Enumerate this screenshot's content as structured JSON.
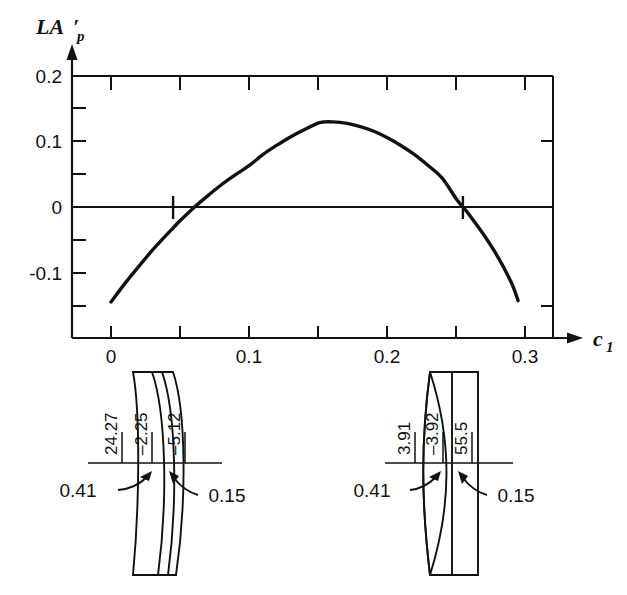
{
  "figure": {
    "background_color": "#ffffff",
    "ink_color": "#111111"
  },
  "chart_data": {
    "type": "line",
    "title": "",
    "subtitle": "",
    "ylabel": "LA'p",
    "ylabel_parts": {
      "main": "LA",
      "prime": "′",
      "subscript": "p"
    },
    "xlabel": "c1",
    "xlabel_parts": {
      "main": "c",
      "subscript": "1"
    },
    "xlim": [
      0.0,
      0.32
    ],
    "ylim": [
      -0.16,
      0.2
    ],
    "xticks": [
      0.0,
      0.05,
      0.1,
      0.15,
      0.2,
      0.25,
      0.3
    ],
    "xtick_labels": [
      "0",
      "",
      "0.1",
      "",
      "0.2",
      "",
      "0.3"
    ],
    "yticks": [
      -0.15,
      -0.1,
      -0.05,
      0.0,
      0.05,
      0.1,
      0.15,
      0.2
    ],
    "ytick_labels": [
      "",
      "-0.1",
      "",
      "0",
      "",
      "0.1",
      "",
      "0.2"
    ],
    "grid": false,
    "legend": "none",
    "zero_line": 0.0,
    "annotations": [
      {
        "name": "left-zero-crossing",
        "x": 0.045,
        "y": 0.0,
        "marker": "vertical-tick"
      },
      {
        "name": "right-zero-crossing",
        "x": 0.255,
        "y": 0.0,
        "marker": "vertical-tick"
      }
    ],
    "series": [
      {
        "name": "LA'p vs c1",
        "x": [
          0.0,
          0.01,
          0.02,
          0.03,
          0.04,
          0.045,
          0.05,
          0.06,
          0.07,
          0.08,
          0.09,
          0.1,
          0.11,
          0.12,
          0.13,
          0.14,
          0.15,
          0.155,
          0.16,
          0.17,
          0.18,
          0.19,
          0.2,
          0.21,
          0.22,
          0.23,
          0.24,
          0.25,
          0.255,
          0.26,
          0.27,
          0.28,
          0.29,
          0.295
        ],
        "values": [
          -0.145,
          -0.117,
          -0.091,
          -0.066,
          -0.043,
          -0.032,
          -0.021,
          -0.001,
          0.017,
          0.034,
          0.049,
          0.063,
          0.08,
          0.094,
          0.107,
          0.118,
          0.128,
          0.13,
          0.13,
          0.128,
          0.123,
          0.116,
          0.106,
          0.094,
          0.08,
          0.063,
          0.044,
          0.013,
          0.0,
          -0.013,
          -0.042,
          -0.075,
          -0.115,
          -0.143
        ]
      }
    ]
  },
  "lens_diagrams": [
    {
      "name": "left-lens",
      "position": "left",
      "labels_vertical": [
        {
          "name": "surface-1-radius",
          "value": "24.27"
        },
        {
          "name": "surface-2-radius",
          "value": "–2.25"
        },
        {
          "name": "surface-3-radius",
          "value": "–5.12"
        }
      ],
      "labels_thickness": [
        {
          "name": "thickness-1",
          "value": "0.41"
        },
        {
          "name": "thickness-2",
          "value": "0.15"
        }
      ]
    },
    {
      "name": "right-lens",
      "position": "right",
      "labels_vertical": [
        {
          "name": "surface-1-radius",
          "value": "3.91"
        },
        {
          "name": "surface-2-radius",
          "value": "–3.92"
        },
        {
          "name": "surface-3-radius",
          "value": "55.5"
        }
      ],
      "labels_thickness": [
        {
          "name": "thickness-1",
          "value": "0.41"
        },
        {
          "name": "thickness-2",
          "value": "0.15"
        }
      ]
    }
  ]
}
